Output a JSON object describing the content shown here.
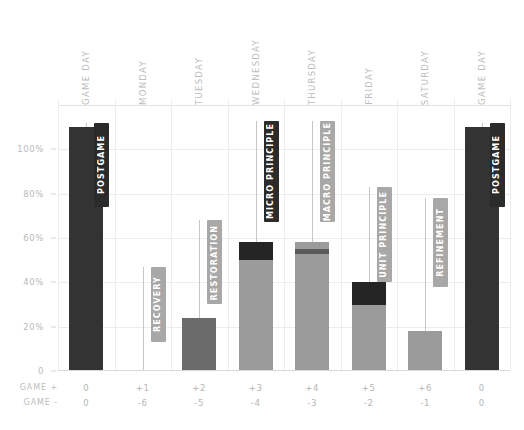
{
  "chart_data": {
    "type": "bar",
    "title": "",
    "subtitle": "",
    "xlabel": "",
    "ylabel": "",
    "ylim": [
      0,
      120
    ],
    "grid": true,
    "legend_position": "none",
    "categories": [
      "GAME DAY",
      "MONDAY",
      "TUESDAY",
      "WEDNESDAY",
      "THURSDAY",
      "FRIDAY",
      "SATURDAY",
      "GAME DAY"
    ],
    "ytick_labels": [
      "0",
      "20%",
      "40%",
      "60%",
      "80%",
      "100%"
    ],
    "ytick_values": [
      0,
      20,
      40,
      60,
      80,
      100
    ],
    "axis_rows": [
      {
        "label": "GAME +",
        "values": [
          "0",
          "+1",
          "+2",
          "+3",
          "+4",
          "+5",
          "+6",
          "0"
        ]
      },
      {
        "label": "GAME -",
        "values": [
          "0",
          "-6",
          "-5",
          "-4",
          "-3",
          "-2",
          "-1",
          "0"
        ]
      }
    ],
    "series": [
      {
        "name": "Lower segment",
        "color": "#9b9b9b",
        "values": [
          0,
          0,
          0,
          50,
          56,
          30,
          18,
          0
        ]
      },
      {
        "name": "Upper segment",
        "color": "#2b2b2b",
        "values": [
          0,
          0,
          0,
          8,
          2,
          10,
          0,
          0
        ]
      },
      {
        "name": "Solid dark",
        "color": "#333333",
        "values": [
          110,
          0,
          0,
          0,
          0,
          0,
          0,
          110
        ]
      },
      {
        "name": "Solid mid",
        "color": "#6b6b6b",
        "values": [
          0,
          0,
          24,
          0,
          0,
          0,
          0,
          0
        ]
      }
    ],
    "bars": [
      {
        "category": "GAME DAY",
        "total": 110,
        "segments": [
          {
            "value": 110,
            "color": "#333333"
          }
        ]
      },
      {
        "category": "MONDAY",
        "total": 0,
        "segments": []
      },
      {
        "category": "TUESDAY",
        "total": 24,
        "segments": [
          {
            "value": 24,
            "color": "#6b6b6b"
          }
        ]
      },
      {
        "category": "WEDNESDAY",
        "total": 58,
        "segments": [
          {
            "value": 50,
            "color": "#9b9b9b"
          },
          {
            "value": 8,
            "color": "#252525"
          }
        ]
      },
      {
        "category": "THURSDAY",
        "total": 58,
        "segments": [
          {
            "value": 53,
            "color": "#9b9b9b"
          },
          {
            "value": 2,
            "color": "#5a5a5a"
          },
          {
            "value": 3,
            "color": "#9b9b9b"
          }
        ]
      },
      {
        "category": "FRIDAY",
        "total": 40,
        "segments": [
          {
            "value": 30,
            "color": "#9b9b9b"
          },
          {
            "value": 10,
            "color": "#252525"
          }
        ]
      },
      {
        "category": "SATURDAY",
        "total": 18,
        "segments": [
          {
            "value": 18,
            "color": "#9b9b9b"
          }
        ]
      },
      {
        "category": "GAME DAY",
        "total": 110,
        "segments": [
          {
            "value": 110,
            "color": "#333333"
          }
        ]
      }
    ],
    "annotations": [
      {
        "text": "POSTGAME",
        "category_index": 0,
        "top_value": 112,
        "bottom_value": 74,
        "fill": "#2b2b2b",
        "text_color": "#ffffff"
      },
      {
        "text": "RECOVERY",
        "category_index": 1,
        "top_value": 47,
        "bottom_value": 13,
        "fill": "#a8a8a8",
        "text_color": "#ffffff"
      },
      {
        "text": "RESTORATION",
        "category_index": 2,
        "top_value": 68,
        "bottom_value": 30,
        "fill": "#a8a8a8",
        "text_color": "#ffffff"
      },
      {
        "text": "MICRO PRINCIPLE",
        "category_index": 3,
        "top_value": 113,
        "bottom_value": 67,
        "fill": "#2b2b2b",
        "text_color": "#ffffff"
      },
      {
        "text": "MACRO PRINCIPLE",
        "category_index": 4,
        "top_value": 113,
        "bottom_value": 67,
        "fill": "#a8a8a8",
        "text_color": "#ffffff"
      },
      {
        "text": "UNIT PRINCIPLE",
        "category_index": 5,
        "top_value": 83,
        "bottom_value": 40,
        "fill": "#a8a8a8",
        "text_color": "#ffffff"
      },
      {
        "text": "REFINEMENT",
        "category_index": 6,
        "top_value": 78,
        "bottom_value": 38,
        "fill": "#a8a8a8",
        "text_color": "#ffffff"
      },
      {
        "text": "POSTGAME",
        "category_index": 7,
        "top_value": 112,
        "bottom_value": 74,
        "fill": "#2b2b2b",
        "text_color": "#ffffff"
      }
    ]
  },
  "colors": {
    "background": "#ffffff",
    "grid": "#ececec",
    "axis_text": "#b9b9b9",
    "dark_bar": "#333333",
    "mid_bar": "#6b6b6b",
    "light_bar": "#9b9b9b",
    "pill_dark": "#2b2b2b",
    "pill_light": "#a8a8a8"
  }
}
